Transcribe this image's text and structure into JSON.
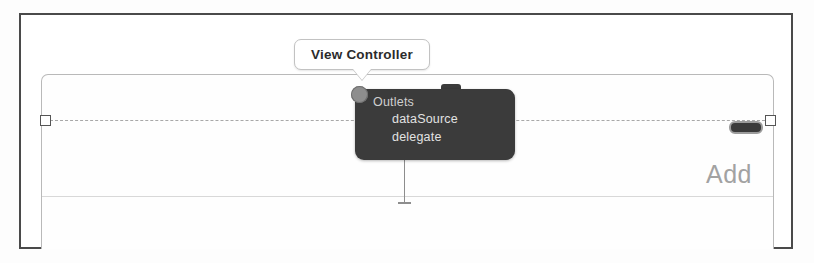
{
  "window": {
    "title": "Interface Builder Connection Popup"
  },
  "callout": {
    "label": "View Controller",
    "icon": "callout-tail-icon"
  },
  "outlets_popup": {
    "header": "Outlets",
    "items": [
      {
        "label": "dataSource"
      },
      {
        "label": "delegate"
      }
    ],
    "background_color": "#3b3b3b",
    "header_color": "#cfcfcf",
    "item_color": "#e2e2e2"
  },
  "scene": {
    "add_label": "Add",
    "add_label_color": "#a2a2a2",
    "pill_indicator_name": "battery-pill-indicator",
    "separator_color": "#d8d8d8",
    "border_color": "#b9b9b9"
  },
  "selection": {
    "left_handle": "resize-handle-left",
    "right_handle": "resize-handle-right",
    "line_style": "dashed"
  },
  "frame": {
    "border_color": "#4a4a4a"
  }
}
